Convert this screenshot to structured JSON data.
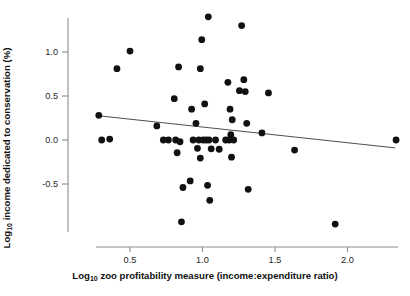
{
  "chart_data": {
    "type": "scatter",
    "title": "",
    "xlabel": "Log10 zoo profitability measure (income:expenditure ratio)",
    "ylabel": "Log10 income dedicated to conservation (%)",
    "xlabel_parts": {
      "prefix": "Log",
      "sub": "10",
      "suffix": " zoo profitability measure (income:expenditure ratio)"
    },
    "ylabel_parts": {
      "prefix": "Log",
      "sub": "10",
      "suffix": " income dedicated to conservation (%)"
    },
    "xlim": [
      0.19,
      2.4
    ],
    "ylim": [
      -1.06,
      1.5
    ],
    "xticks": [
      0.5,
      1.0,
      1.5,
      2.0
    ],
    "xtick_labels": [
      "0.5",
      "1.0",
      "1.5",
      "2.0"
    ],
    "yticks": [
      1.0,
      0.5,
      0.0,
      -0.5
    ],
    "ytick_labels": [
      "1.0",
      "0.5",
      "0.0",
      "-0.5"
    ],
    "grid": false,
    "legend": null,
    "marker": {
      "shape": "circle",
      "color": "#111111",
      "size": 4.6
    },
    "points": [
      {
        "x": 0.285,
        "y": 0.28
      },
      {
        "x": 0.305,
        "y": 0.0
      },
      {
        "x": 0.36,
        "y": 0.01
      },
      {
        "x": 0.41,
        "y": 0.81
      },
      {
        "x": 0.5,
        "y": 1.01
      },
      {
        "x": 0.685,
        "y": 0.16
      },
      {
        "x": 0.73,
        "y": 0.0
      },
      {
        "x": 0.765,
        "y": 0.0
      },
      {
        "x": 0.805,
        "y": 0.47
      },
      {
        "x": 0.815,
        "y": 0.0
      },
      {
        "x": 0.825,
        "y": -0.145
      },
      {
        "x": 0.835,
        "y": 0.83
      },
      {
        "x": 0.845,
        "y": -0.02
      },
      {
        "x": 0.855,
        "y": -0.93
      },
      {
        "x": 0.865,
        "y": -0.54
      },
      {
        "x": 0.915,
        "y": -0.465
      },
      {
        "x": 0.925,
        "y": 0.35
      },
      {
        "x": 0.935,
        "y": 0.0
      },
      {
        "x": 0.955,
        "y": 0.19
      },
      {
        "x": 0.965,
        "y": -0.095
      },
      {
        "x": 0.975,
        "y": 0.0
      },
      {
        "x": 0.985,
        "y": 0.81
      },
      {
        "x": 0.985,
        "y": -0.205
      },
      {
        "x": 0.995,
        "y": 1.14
      },
      {
        "x": 1.005,
        "y": 0.0
      },
      {
        "x": 1.015,
        "y": 0.41
      },
      {
        "x": 1.025,
        "y": 0.0
      },
      {
        "x": 1.035,
        "y": -0.515
      },
      {
        "x": 1.04,
        "y": 1.4
      },
      {
        "x": 1.045,
        "y": 0.0
      },
      {
        "x": 1.05,
        "y": -0.685
      },
      {
        "x": 1.06,
        "y": -0.1
      },
      {
        "x": 1.09,
        "y": 0.0
      },
      {
        "x": 1.115,
        "y": -0.105
      },
      {
        "x": 1.16,
        "y": 0.0
      },
      {
        "x": 1.175,
        "y": 0.655
      },
      {
        "x": 1.185,
        "y": 0.0
      },
      {
        "x": 1.19,
        "y": 0.35
      },
      {
        "x": 1.195,
        "y": 0.06
      },
      {
        "x": 1.2,
        "y": -0.195
      },
      {
        "x": 1.205,
        "y": 0.23
      },
      {
        "x": 1.215,
        "y": 0.0
      },
      {
        "x": 1.255,
        "y": 0.56
      },
      {
        "x": 1.27,
        "y": 1.3
      },
      {
        "x": 1.285,
        "y": 0.685
      },
      {
        "x": 1.295,
        "y": 0.55
      },
      {
        "x": 1.305,
        "y": 0.19
      },
      {
        "x": 1.315,
        "y": -0.56
      },
      {
        "x": 1.41,
        "y": 0.08
      },
      {
        "x": 1.455,
        "y": 0.535
      },
      {
        "x": 1.635,
        "y": -0.115
      },
      {
        "x": 1.915,
        "y": -0.955
      },
      {
        "x": 2.335,
        "y": 0.0
      }
    ],
    "trendline": {
      "type": "linear",
      "x_start": 0.285,
      "y_start": 0.275,
      "x_end": 2.33,
      "y_end": -0.09,
      "slope": -0.178,
      "intercept": 0.326
    }
  }
}
